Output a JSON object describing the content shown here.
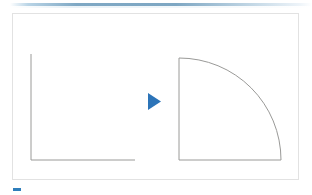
{
  "slide": {
    "background_color": "#ffffff",
    "width": 312,
    "height": 195,
    "title_text": "",
    "top_rule": {
      "name": "top-divider-rule",
      "color_start": "#b9d4e6",
      "color_mid": "#7ea7c3",
      "color_end": "#ffffff"
    },
    "bottom_marker": {
      "name": "bottom-left-marker",
      "color": "#2e7ebb",
      "label": ""
    }
  },
  "content_frame": {
    "border_color": "#e2e2e2",
    "fill_color": "#ffffff",
    "label": ""
  },
  "diagram": {
    "stroke_color": "#9a9a98",
    "stroke_width": 1,
    "left_shape": {
      "name": "right-angle-lines",
      "label": "",
      "description": "two perpendicular line segments forming a right angle",
      "vertical_x": 31,
      "vertical_top_y": 54,
      "corner_x": 31,
      "corner_y": 160,
      "horizontal_end_x": 135,
      "horizontal_y": 160
    },
    "arrow": {
      "name": "play-arrow",
      "label": "",
      "color": "#2c74b8",
      "direction": "right",
      "x": 148,
      "y": 93,
      "width": 13,
      "height": 17
    },
    "right_shape": {
      "name": "quarter-circle-sector",
      "label": "",
      "description": "quarter circle sector with centre at bottom left corner",
      "center_x": 179,
      "center_y": 160,
      "radius": 102,
      "top_point_x": 179,
      "top_point_y": 58,
      "right_point_x": 281,
      "right_point_y": 160
    }
  }
}
